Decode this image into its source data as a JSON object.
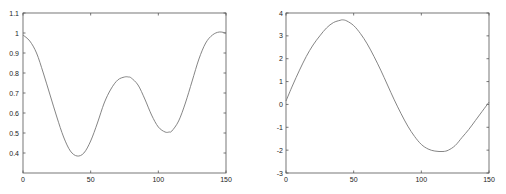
{
  "chart_data": [
    {
      "type": "line",
      "title": "",
      "xlabel": "",
      "ylabel": "",
      "xlim": [
        0,
        150
      ],
      "ylim": [
        0.3,
        1.1
      ],
      "grid": false,
      "xticks": [
        "0",
        "50",
        "100",
        "150"
      ],
      "yticks": [
        "0.4",
        "0.5",
        "0.6",
        "0.7",
        "0.8",
        "0.9",
        "1",
        "1.1"
      ],
      "series": [
        {
          "name": "curve",
          "x": [
            0,
            5,
            10,
            15,
            20,
            25,
            30,
            35,
            40,
            45,
            50,
            55,
            60,
            65,
            70,
            75,
            78,
            80,
            85,
            90,
            95,
            100,
            105,
            108,
            110,
            115,
            120,
            125,
            130,
            135,
            140,
            145,
            150
          ],
          "y": [
            0.99,
            0.96,
            0.9,
            0.8,
            0.69,
            0.58,
            0.48,
            0.41,
            0.385,
            0.4,
            0.46,
            0.55,
            0.65,
            0.72,
            0.765,
            0.78,
            0.78,
            0.775,
            0.74,
            0.67,
            0.59,
            0.53,
            0.505,
            0.505,
            0.51,
            0.56,
            0.65,
            0.76,
            0.87,
            0.95,
            0.99,
            1.005,
            1.0
          ]
        }
      ]
    },
    {
      "type": "line",
      "title": "",
      "xlabel": "",
      "ylabel": "",
      "xlim": [
        0,
        150
      ],
      "ylim": [
        -3,
        4
      ],
      "grid": false,
      "xticks": [
        "0",
        "50",
        "100",
        "150"
      ],
      "yticks": [
        "-3",
        "-2",
        "-1",
        "0",
        "1",
        "2",
        "3",
        "4"
      ],
      "series": [
        {
          "name": "curve",
          "x": [
            0,
            5,
            10,
            15,
            20,
            25,
            30,
            35,
            40,
            42,
            45,
            50,
            55,
            60,
            65,
            70,
            75,
            80,
            85,
            90,
            95,
            100,
            105,
            110,
            116,
            120,
            125,
            130,
            135,
            140,
            145,
            150
          ],
          "y": [
            0.15,
            0.85,
            1.5,
            2.1,
            2.6,
            3.0,
            3.35,
            3.58,
            3.68,
            3.7,
            3.65,
            3.45,
            3.1,
            2.65,
            2.1,
            1.5,
            0.85,
            0.2,
            -0.4,
            -0.95,
            -1.4,
            -1.75,
            -1.95,
            -2.04,
            -2.06,
            -2.0,
            -1.8,
            -1.45,
            -1.1,
            -0.7,
            -0.3,
            0.1
          ]
        }
      ]
    }
  ],
  "charts": [
    {
      "xticks": [
        "0",
        "50",
        "100",
        "150"
      ],
      "yticks": [
        "0.4",
        "0.5",
        "0.6",
        "0.7",
        "0.8",
        "0.9",
        "1",
        "1.1"
      ]
    },
    {
      "xticks": [
        "0",
        "50",
        "100",
        "150"
      ],
      "yticks": [
        "-3",
        "-2",
        "-1",
        "0",
        "1",
        "2",
        "3",
        "4"
      ]
    }
  ]
}
